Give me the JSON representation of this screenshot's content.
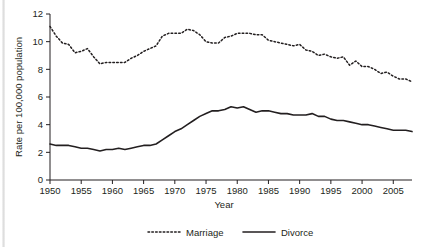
{
  "chart_data": {
    "type": "line",
    "title": "",
    "xlabel": "Year",
    "ylabel": "Rate per 100,000 population",
    "xlim": [
      1950,
      2008
    ],
    "ylim": [
      0,
      12
    ],
    "grid": false,
    "legend_position": "bottom",
    "xticks": [
      1950,
      1955,
      1960,
      1965,
      1970,
      1975,
      1980,
      1985,
      1990,
      1995,
      2000,
      2005
    ],
    "yticks": [
      0,
      2,
      4,
      6,
      8,
      10,
      12
    ],
    "x": [
      1950,
      1951,
      1952,
      1953,
      1954,
      1955,
      1956,
      1957,
      1958,
      1959,
      1960,
      1961,
      1962,
      1963,
      1964,
      1965,
      1966,
      1967,
      1968,
      1969,
      1970,
      1971,
      1972,
      1973,
      1974,
      1975,
      1976,
      1977,
      1978,
      1979,
      1980,
      1981,
      1982,
      1983,
      1984,
      1985,
      1986,
      1987,
      1988,
      1989,
      1990,
      1991,
      1992,
      1993,
      1994,
      1995,
      1996,
      1997,
      1998,
      1999,
      2000,
      2001,
      2002,
      2003,
      2004,
      2005,
      2006,
      2007,
      2008
    ],
    "series": [
      {
        "name": "Marriage",
        "style": "dotted",
        "color": "#231f20",
        "values": [
          11.1,
          10.4,
          9.9,
          9.8,
          9.2,
          9.3,
          9.5,
          8.9,
          8.4,
          8.5,
          8.5,
          8.5,
          8.5,
          8.8,
          9.0,
          9.3,
          9.5,
          9.7,
          10.4,
          10.6,
          10.6,
          10.6,
          10.9,
          10.8,
          10.5,
          10.0,
          9.9,
          9.9,
          10.3,
          10.4,
          10.6,
          10.6,
          10.6,
          10.5,
          10.5,
          10.1,
          10.0,
          9.9,
          9.8,
          9.7,
          9.8,
          9.4,
          9.3,
          9.0,
          9.1,
          8.9,
          8.8,
          8.9,
          8.3,
          8.6,
          8.2,
          8.2,
          8.0,
          7.7,
          7.8,
          7.5,
          7.3,
          7.3,
          7.1
        ]
      },
      {
        "name": "Divorce",
        "style": "solid",
        "color": "#231f20",
        "values": [
          2.6,
          2.5,
          2.5,
          2.5,
          2.4,
          2.3,
          2.3,
          2.2,
          2.1,
          2.2,
          2.2,
          2.3,
          2.2,
          2.3,
          2.4,
          2.5,
          2.5,
          2.6,
          2.9,
          3.2,
          3.5,
          3.7,
          4.0,
          4.3,
          4.6,
          4.8,
          5.0,
          5.0,
          5.1,
          5.3,
          5.2,
          5.3,
          5.1,
          4.9,
          5.0,
          5.0,
          4.9,
          4.8,
          4.8,
          4.7,
          4.7,
          4.7,
          4.8,
          4.6,
          4.6,
          4.4,
          4.3,
          4.3,
          4.2,
          4.1,
          4.0,
          4.0,
          3.9,
          3.8,
          3.7,
          3.6,
          3.6,
          3.6,
          3.5
        ]
      }
    ]
  },
  "legend": {
    "entries": [
      {
        "label": "Marriage",
        "style": "dotted"
      },
      {
        "label": "Divorce",
        "style": "solid"
      }
    ]
  }
}
